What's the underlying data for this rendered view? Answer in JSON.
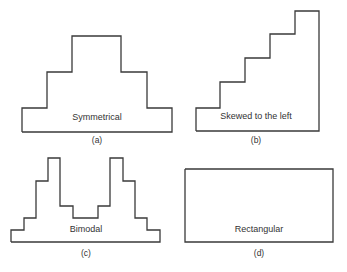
{
  "panels": [
    {
      "id": "a",
      "label": "Symmetrical",
      "caption": "(a)",
      "points": "22,132 22,108 47,108 47,72 72,72 72,36 121,36 121,72 147,72 147,108 172,108 172,132 22,132",
      "label_pos": [
        97,
        118
      ],
      "caption_pos": [
        97,
        140
      ]
    },
    {
      "id": "b",
      "label": "Skewed to the left",
      "caption": "(b)",
      "points": "196,131 196,108 220,108 220,82 245,82 245,58 270,58 270,34 295,34 295,11 319,11 319,131 196,131",
      "label_pos": [
        254,
        117
      ],
      "caption_pos": [
        256,
        139
      ]
    },
    {
      "id": "c",
      "label": "Bimodal",
      "caption": "(c)",
      "points": "11,242 11,230 24,230 24,218 36,218 36,181 48,181 48,158 60,158 60,206 73,206 73,218 98,218 98,206 110,206 110,158 123,158 123,181 135,181 135,218 147,218 147,230 160,230 160,242 11,242",
      "label_pos": [
        86,
        229
      ],
      "caption_pos": [
        86,
        251
      ]
    },
    {
      "id": "d",
      "label": "Rectangular",
      "caption": "(d)",
      "points": "185,169 333,169 333,242 185,242 185,169",
      "label_pos": [
        259,
        229
      ],
      "caption_pos": [
        259,
        251
      ]
    }
  ]
}
